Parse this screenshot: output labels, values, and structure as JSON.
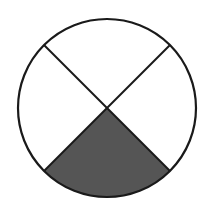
{
  "diagram": {
    "type": "fraction-circle",
    "total_parts": 4,
    "shaded_parts": 1,
    "shaded_part_position": "bottom",
    "fraction": "1/4",
    "colors": {
      "background": "#ffffff",
      "outline": "#1a1a1a",
      "shaded": "#555555",
      "unshaded": "#ffffff"
    },
    "geometry": {
      "cx": 107,
      "cy": 108,
      "r": 89
    }
  }
}
